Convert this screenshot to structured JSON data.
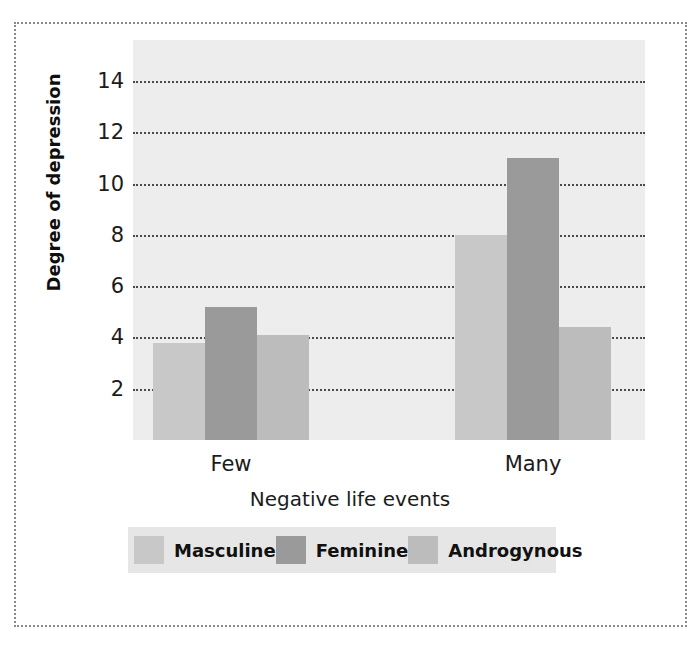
{
  "chart_data": {
    "type": "bar",
    "title": "",
    "xlabel": "Negative life events",
    "ylabel": "Degree of depression",
    "categories": [
      "Few",
      "Many"
    ],
    "series": [
      {
        "name": "Masculine",
        "values": [
          3.8,
          8.0
        ],
        "color": "#c8c8c8"
      },
      {
        "name": "Feminine",
        "values": [
          5.2,
          11.0
        ],
        "color": "#9a9a9a"
      },
      {
        "name": "Androgynous",
        "values": [
          4.1,
          4.4
        ],
        "color": "#bcbcbc"
      }
    ],
    "ylim": [
      0,
      15.6
    ],
    "yticks": [
      2,
      4,
      6,
      8,
      10,
      12,
      14
    ],
    "ytick_labels": [
      "2",
      "4",
      "6",
      "8",
      "10",
      "12",
      "14"
    ],
    "grid": true,
    "grid_style": "dotted",
    "legend_position": "bottom",
    "plot_background": "#ededed",
    "figure_background": "#ffffff",
    "frame_style": "dotted"
  }
}
